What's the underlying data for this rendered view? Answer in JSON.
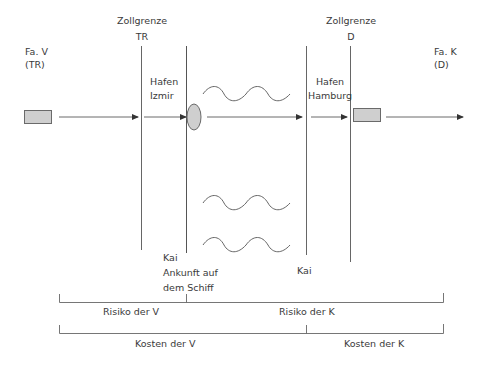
{
  "diagram": {
    "type": "incoterm-risk-cost-transfer",
    "parties": {
      "seller": {
        "label_line1": "Fa. V",
        "label_line2": "(TR)"
      },
      "buyer": {
        "label_line1": "Fa. K",
        "label_line2": "(D)"
      }
    },
    "borders": {
      "tr": {
        "title": "Zollgrenze",
        "code": "TR"
      },
      "d": {
        "title": "Zollgrenze",
        "code": "D"
      }
    },
    "ports": {
      "izmir": {
        "line1": "Hafen",
        "line2": "Izmir"
      },
      "hamburg": {
        "line1": "Hafen",
        "line2": "Hamburg"
      }
    },
    "quays": {
      "izmir": {
        "line1": "Kai",
        "line2": "Ankunft auf",
        "line3": "dem Schiff"
      },
      "hamburg": {
        "line1": "Kai"
      }
    },
    "transfer_point_label": "Ankunft auf dem Schiff",
    "risk": {
      "seller": "Risiko der V",
      "buyer": "Risiko der K"
    },
    "costs": {
      "seller": "Kosten der V",
      "buyer": "Kosten der K"
    },
    "colors": {
      "line": "#5a5a5a",
      "box_fill": "#cfcfcf",
      "box_stroke": "#6a6a6a",
      "text": "#3a3a3a"
    }
  }
}
